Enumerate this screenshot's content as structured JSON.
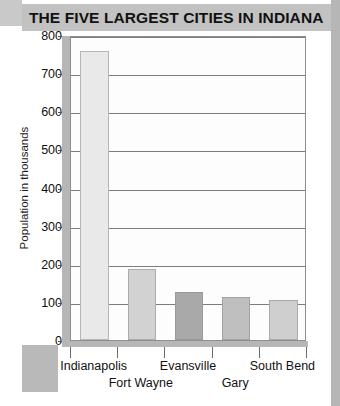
{
  "title": "THE FIVE LARGEST CITIES IN INDIANA",
  "chart_data": {
    "type": "bar",
    "title": "THE FIVE LARGEST CITIES IN INDIANA",
    "xlabel": "",
    "ylabel": "Population in thousands",
    "categories": [
      "Indianapolis",
      "Fort Wayne",
      "Evansville",
      "Gary",
      "South Bend"
    ],
    "values": [
      757,
      186,
      126,
      112,
      105
    ],
    "ylim": [
      0,
      800
    ],
    "yticks": [
      0,
      100,
      200,
      300,
      400,
      500,
      600,
      700,
      800
    ],
    "ytick_labels": [
      "0",
      "100",
      "200",
      "300",
      "400",
      "500",
      "600",
      "700",
      "800"
    ],
    "grid": true,
    "legend": "none",
    "bar_colors": [
      "#e9e9e9",
      "#d2d2d2",
      "#a9a9a9",
      "#bfbfbf",
      "#cfcfcf"
    ],
    "label_rows": [
      1,
      2,
      1,
      2,
      1
    ]
  },
  "colors": {
    "banner": "#c2c2c2",
    "axis_bar": "#b6b6b6",
    "gridline": "#7d7d7d",
    "plot_border": "#8e8e8e",
    "text": "#111111",
    "page_background": "#ffffff"
  }
}
